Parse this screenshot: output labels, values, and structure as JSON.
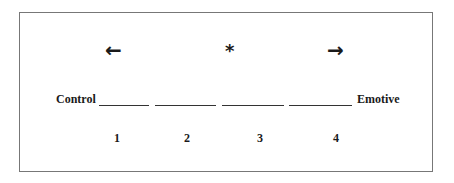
{
  "scale": {
    "arrows": {
      "left": "←",
      "center": "*",
      "right": "→"
    },
    "left_anchor": "Control",
    "right_anchor": "Emotive",
    "positions": [
      {
        "number": "1"
      },
      {
        "number": "2"
      },
      {
        "number": "3"
      },
      {
        "number": "4"
      }
    ]
  }
}
